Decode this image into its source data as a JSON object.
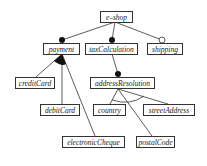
{
  "diagram": {
    "type": "feature-model",
    "nodes": {
      "root": {
        "label": "e–shop"
      },
      "payment": {
        "label": "payment"
      },
      "taxCalculation": {
        "label": "taxCalculation"
      },
      "shipping": {
        "label": "shipping"
      },
      "creditCard": {
        "label": "creditCard"
      },
      "debitCard": {
        "label": "debitCard"
      },
      "electronicCheque": {
        "label": "electronicCheque"
      },
      "addressResolution": {
        "label": "addressResolution"
      },
      "country": {
        "label": "country"
      },
      "streetAddress": {
        "label": "streetAddress"
      },
      "postalCode": {
        "label": "postalCode"
      }
    },
    "edges": [
      {
        "from": "e-shop",
        "to": "payment",
        "kind": "mandatory"
      },
      {
        "from": "e-shop",
        "to": "taxCalculation",
        "kind": "mandatory"
      },
      {
        "from": "e-shop",
        "to": "shipping",
        "kind": "optional"
      },
      {
        "from": "payment",
        "to": [
          "creditCard",
          "debitCard",
          "electronicCheque"
        ],
        "kind": "or-group"
      },
      {
        "from": "taxCalculation",
        "to": "addressResolution",
        "kind": "mandatory"
      },
      {
        "from": "addressResolution",
        "to": [
          "country",
          "streetAddress",
          "postalCode"
        ],
        "kind": "alternative-group"
      }
    ],
    "colors": {
      "line": "#333333",
      "box_border": "#333333",
      "text": "#222222",
      "background": "#ffffff"
    }
  }
}
